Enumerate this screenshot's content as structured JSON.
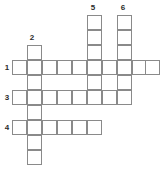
{
  "puzzle": {
    "type": "crossword-grid",
    "title": "Crossword puzzle blank grid",
    "cell_size": 15,
    "grid_origin": {
      "x": 12,
      "y": 45
    },
    "ink_color": "#8a8a8a",
    "cell_fill": "#ffffff",
    "background": "#ffffff",
    "number_color": "#2b2b2b",
    "clue_numbers": [
      {
        "id": "1",
        "label": "1",
        "x": 2,
        "y": 63,
        "direction": "across"
      },
      {
        "id": "2",
        "label": "2",
        "x": 27,
        "y": 33,
        "direction": "down"
      },
      {
        "id": "3",
        "label": "3",
        "x": 2,
        "y": 93,
        "direction": "across"
      },
      {
        "id": "4",
        "label": "4",
        "x": 2,
        "y": 123,
        "direction": "across"
      },
      {
        "id": "5",
        "label": "5",
        "x": 88,
        "y": 3,
        "direction": "down"
      },
      {
        "id": "6",
        "label": "6",
        "x": 118,
        "y": 3,
        "direction": "down"
      }
    ],
    "entries": [
      {
        "number": "1",
        "direction": "across",
        "length": 10,
        "row_y": 60,
        "start_x": 12,
        "answer": ""
      },
      {
        "number": "2",
        "direction": "down",
        "length": 8,
        "col_x": 27,
        "start_y": 45,
        "answer": ""
      },
      {
        "number": "3",
        "direction": "across",
        "length": 8,
        "row_y": 90,
        "start_x": 12,
        "answer": ""
      },
      {
        "number": "4",
        "direction": "across",
        "length": 6,
        "row_y": 120,
        "start_x": 12,
        "answer": ""
      },
      {
        "number": "5",
        "direction": "down",
        "length": 6,
        "col_x": 87,
        "start_y": 15,
        "answer": ""
      },
      {
        "number": "6",
        "direction": "down",
        "length": 6,
        "col_x": 117,
        "start_y": 15,
        "answer": ""
      }
    ],
    "cells": [
      {
        "name": "cell-r1-c1",
        "x": 12,
        "y": 60,
        "letter": ""
      },
      {
        "name": "cell-r1-c2",
        "x": 27,
        "y": 60,
        "letter": ""
      },
      {
        "name": "cell-r1-c3",
        "x": 42,
        "y": 60,
        "letter": ""
      },
      {
        "name": "cell-r1-c4",
        "x": 57,
        "y": 60,
        "letter": ""
      },
      {
        "name": "cell-r1-c5",
        "x": 72,
        "y": 60,
        "letter": ""
      },
      {
        "name": "cell-r1-c6",
        "x": 87,
        "y": 60,
        "letter": ""
      },
      {
        "name": "cell-r1-c7",
        "x": 102,
        "y": 60,
        "letter": ""
      },
      {
        "name": "cell-r1-c8",
        "x": 117,
        "y": 60,
        "letter": ""
      },
      {
        "name": "cell-r1-c9",
        "x": 132,
        "y": 60,
        "letter": ""
      },
      {
        "name": "cell-r1-c10",
        "x": 145,
        "y": 60,
        "letter": ""
      },
      {
        "name": "cell-r3-c1",
        "x": 12,
        "y": 90,
        "letter": ""
      },
      {
        "name": "cell-r3-c2",
        "x": 27,
        "y": 90,
        "letter": ""
      },
      {
        "name": "cell-r3-c3",
        "x": 42,
        "y": 90,
        "letter": ""
      },
      {
        "name": "cell-r3-c4",
        "x": 57,
        "y": 90,
        "letter": ""
      },
      {
        "name": "cell-r3-c5",
        "x": 72,
        "y": 90,
        "letter": ""
      },
      {
        "name": "cell-r3-c6",
        "x": 87,
        "y": 90,
        "letter": ""
      },
      {
        "name": "cell-r3-c7",
        "x": 102,
        "y": 90,
        "letter": ""
      },
      {
        "name": "cell-r3-c8",
        "x": 117,
        "y": 90,
        "letter": ""
      },
      {
        "name": "cell-r4-c1",
        "x": 12,
        "y": 120,
        "letter": ""
      },
      {
        "name": "cell-r4-c2",
        "x": 27,
        "y": 120,
        "letter": ""
      },
      {
        "name": "cell-r4-c3",
        "x": 42,
        "y": 120,
        "letter": ""
      },
      {
        "name": "cell-r4-c4",
        "x": 57,
        "y": 120,
        "letter": ""
      },
      {
        "name": "cell-r4-c5",
        "x": 72,
        "y": 120,
        "letter": ""
      },
      {
        "name": "cell-r4-c6",
        "x": 87,
        "y": 120,
        "letter": ""
      },
      {
        "name": "cell-c2-r1",
        "x": 27,
        "y": 45,
        "letter": ""
      },
      {
        "name": "cell-c2-r2",
        "x": 27,
        "y": 75,
        "letter": ""
      },
      {
        "name": "cell-c2-r3",
        "x": 27,
        "y": 105,
        "letter": ""
      },
      {
        "name": "cell-c2-r4",
        "x": 27,
        "y": 135,
        "letter": ""
      },
      {
        "name": "cell-c2-r5",
        "x": 27,
        "y": 150,
        "letter": ""
      },
      {
        "name": "cell-c5-r1",
        "x": 87,
        "y": 15,
        "letter": ""
      },
      {
        "name": "cell-c5-r2",
        "x": 87,
        "y": 30,
        "letter": ""
      },
      {
        "name": "cell-c5-r3",
        "x": 87,
        "y": 45,
        "letter": ""
      },
      {
        "name": "cell-c5-r4",
        "x": 87,
        "y": 75,
        "letter": ""
      },
      {
        "name": "cell-c6-r1",
        "x": 117,
        "y": 15,
        "letter": ""
      },
      {
        "name": "cell-c6-r2",
        "x": 117,
        "y": 30,
        "letter": ""
      },
      {
        "name": "cell-c6-r3",
        "x": 117,
        "y": 45,
        "letter": ""
      },
      {
        "name": "cell-c6-r4",
        "x": 117,
        "y": 75,
        "letter": ""
      }
    ]
  }
}
